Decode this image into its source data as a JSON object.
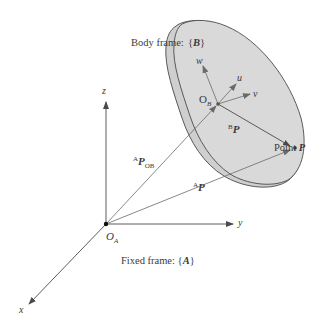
{
  "diagram": {
    "body_frame": {
      "label": "Body frame:",
      "name_open": "{",
      "name": "B",
      "name_close": "}",
      "fill_color": "#d9d9d9",
      "outline_color": "#4a4a4a"
    },
    "body_axes": {
      "w": "w",
      "u": "u",
      "v": "v"
    },
    "body_origin": {
      "base": "O",
      "sub": "B"
    },
    "vector_BP": {
      "sup": "B",
      "base": "P"
    },
    "point_P": {
      "label_prefix": "Point ",
      "name": "P"
    },
    "vector_APOB": {
      "sup": "A",
      "base": "P",
      "sub": "OB"
    },
    "vector_AP": {
      "sup": "A",
      "base": "P"
    },
    "fixed_axes": {
      "x": "x",
      "y": "y",
      "z": "z"
    },
    "fixed_origin": {
      "base": "O",
      "sub": "A"
    },
    "fixed_frame": {
      "label": "Fixed frame:",
      "name_open": "{",
      "name": "A",
      "name_close": "}"
    },
    "colors": {
      "axis_line": "#4a4a4a",
      "vector_line": "#6a6a6a",
      "text": "#3a3a3a",
      "background": "#ffffff"
    }
  }
}
